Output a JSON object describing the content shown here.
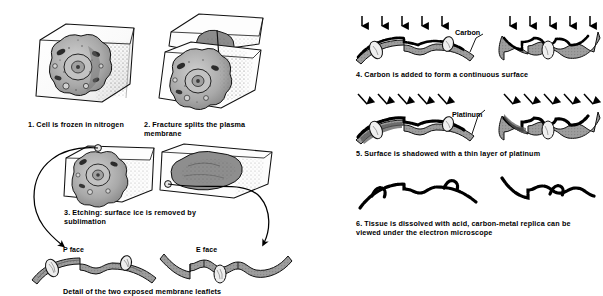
{
  "figure": {
    "title_caption": "Detail of the two exposed membrane leaflets",
    "style": {
      "ink": "#000000",
      "membrane_fill": "#9a9a9a",
      "cytoplasm_fill": "#b5b5b5",
      "ice_fill": "#ffffff",
      "stipple": "#6e6e6e"
    }
  },
  "left_column": {
    "steps": [
      {
        "num": "1.",
        "text": "Cell is frozen in nitrogen"
      },
      {
        "num": "2.",
        "text": "Fracture splits the plasma membrane"
      },
      {
        "num": "3.",
        "text": "Etching: surface ice is removed by sublimation"
      }
    ],
    "face_labels": [
      {
        "name": "p-face",
        "text": "P face"
      },
      {
        "name": "e-face",
        "text": "E face"
      }
    ]
  },
  "right_column": {
    "steps": [
      {
        "num": "4.",
        "text": "Carbon is added to form  a continuous surface",
        "callout": "Carbon"
      },
      {
        "num": "5.",
        "text": "Surface is shadowed with  a thin layer of platinum",
        "callout": "Platinum"
      },
      {
        "num": "6.",
        "text": "Tissue is dissolved with acid, carbon-metal replica can be viewed under the electron  microscope",
        "callout": ""
      }
    ]
  }
}
